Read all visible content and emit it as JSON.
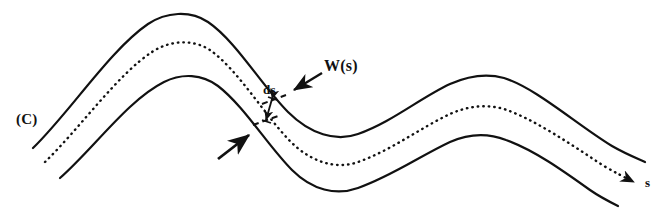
{
  "figure": {
    "type": "line-diagram",
    "background_color": "#ffffff",
    "stroke_color": "#111111",
    "width_px": 668,
    "height_px": 216
  },
  "labels": {
    "curve_label": "(C)",
    "width_label": "W(s)",
    "arc_element_label": "ds",
    "arclength_axis_label": "s"
  },
  "curves": [
    {
      "name": "outer-upper-curve",
      "style": "solid",
      "stroke_width": 2.2,
      "path": "M 33 148 C 70 112 110 50 148 24 C 166 12 190 10 208 22 C 236 41 262 86 288 112 C 310 134 336 142 358 134 C 392 122 420 98 450 84 C 468 76 486 73 504 78 C 536 88 576 124 612 146 C 624 153 636 158 645 162"
    },
    {
      "name": "centerline-dotted-curve",
      "style": "dotted",
      "stroke_width": 2.4,
      "dash": "0.5 5",
      "path": "M 45 162 C 80 128 118 74 152 52 C 170 40 193 39 210 50 C 238 70 264 114 289 140 C 310 162 336 170 358 162 C 392 150 420 128 450 114 C 468 106 486 104 504 109 C 536 120 570 144 604 166 C 616 173 626 178 634 182"
    },
    {
      "name": "inner-lower-curve",
      "style": "solid",
      "stroke_width": 2.2,
      "path": "M 60 178 C 94 148 128 100 164 82 C 182 73 202 74 218 86 C 244 106 268 146 292 170 C 312 190 336 196 358 188 C 392 176 420 156 450 142 C 468 134 488 133 506 140 C 534 150 562 170 590 190 C 600 197 610 202 618 206"
    }
  ],
  "annotations": [
    {
      "name": "width-arrow",
      "kind": "arrow",
      "points_to": "outer-upper-curve",
      "from": [
        322,
        73
      ],
      "to": [
        291,
        92
      ]
    },
    {
      "name": "inner-edge-arrow",
      "kind": "arrow",
      "points_to": "inner-lower-curve",
      "from": [
        219,
        158
      ],
      "to": [
        252,
        133
      ]
    },
    {
      "name": "ds-tick-upper",
      "kind": "dashed-tick",
      "from": [
        262,
        103
      ],
      "to": [
        285,
        95
      ]
    },
    {
      "name": "ds-tick-lower",
      "kind": "dashed-tick",
      "from": [
        254,
        124
      ],
      "to": [
        277,
        116
      ]
    },
    {
      "name": "ds-double-arrow",
      "kind": "double-arrow",
      "from": [
        272,
        98
      ],
      "to": [
        266,
        120
      ]
    },
    {
      "name": "arclength-arrowhead",
      "kind": "arrowhead",
      "at": [
        634,
        182
      ],
      "direction": "right-down"
    }
  ]
}
